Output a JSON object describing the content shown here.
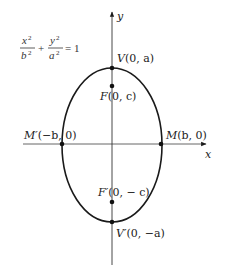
{
  "equation": {
    "term1_num": "x",
    "term1_num_exp": "2",
    "term1_den": "b",
    "term1_den_exp": "2",
    "plus": "+",
    "term2_num": "y",
    "term2_num_exp": "2",
    "term2_den": "a",
    "term2_den_exp": "2",
    "equals": "= 1"
  },
  "axes": {
    "x_label": "x",
    "y_label": "y"
  },
  "points": {
    "V": {
      "name": "V",
      "coords": "(0, a)"
    },
    "F": {
      "name": "F",
      "coords": "(0, c)"
    },
    "M1": {
      "name": "M′",
      "coords": "(−b, 0)"
    },
    "M": {
      "name": "M",
      "coords": "(b, 0)"
    },
    "F1": {
      "name": "F′",
      "coords": "(0, − c)"
    },
    "V1": {
      "name": "V′",
      "coords": "(0, −a)"
    }
  },
  "colors": {
    "stroke": "#1a1a1a",
    "axis": "#333333",
    "background": "#ffffff"
  }
}
